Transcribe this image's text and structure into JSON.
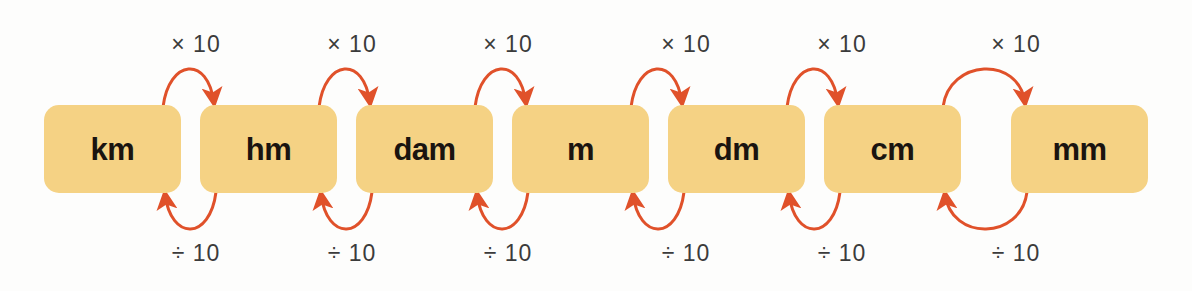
{
  "diagram": {
    "type": "unit-conversion-ladder",
    "background_color": "#fdfdfc",
    "box_fill_color": "#f5d284",
    "box_text_color": "#1a1410",
    "arrow_color": "#e0512a",
    "label_text_color": "#3b3b3b",
    "units": [
      {
        "label": "km",
        "x": 44,
        "y": 105,
        "width": 137,
        "height": 88
      },
      {
        "label": "hm",
        "x": 200,
        "y": 105,
        "width": 137,
        "height": 88
      },
      {
        "label": "dam",
        "x": 356,
        "y": 105,
        "width": 137,
        "height": 88
      },
      {
        "label": "m",
        "x": 512,
        "y": 105,
        "width": 137,
        "height": 88
      },
      {
        "label": "dm",
        "x": 668,
        "y": 105,
        "width": 137,
        "height": 88
      },
      {
        "label": "cm",
        "x": 824,
        "y": 105,
        "width": 137,
        "height": 88
      },
      {
        "label": "mm",
        "x": 1011,
        "y": 105,
        "width": 137,
        "height": 88
      }
    ],
    "multiply_label": "× 10",
    "divide_label": "÷ 10",
    "multiply_transitions": [
      {
        "from": "km",
        "to": "hm",
        "label": "× 10",
        "center_x": 196
      },
      {
        "from": "hm",
        "to": "dam",
        "label": "× 10",
        "center_x": 352
      },
      {
        "from": "dam",
        "to": "m",
        "label": "× 10",
        "center_x": 508
      },
      {
        "from": "m",
        "to": "dm",
        "label": "× 10",
        "center_x": 686
      },
      {
        "from": "dm",
        "to": "cm",
        "label": "× 10",
        "center_x": 842
      },
      {
        "from": "cm",
        "to": "mm",
        "label": "× 10",
        "center_x": 1016
      }
    ],
    "divide_transitions": [
      {
        "from": "hm",
        "to": "km",
        "label": "÷ 10",
        "center_x": 196
      },
      {
        "from": "dam",
        "to": "hm",
        "label": "÷ 10",
        "center_x": 352
      },
      {
        "from": "m",
        "to": "dam",
        "label": "÷ 10",
        "center_x": 508
      },
      {
        "from": "dm",
        "to": "m",
        "label": "÷ 10",
        "center_x": 686
      },
      {
        "from": "cm",
        "to": "dm",
        "label": "÷ 10",
        "center_x": 842
      },
      {
        "from": "mm",
        "to": "cm",
        "label": "÷ 10",
        "center_x": 1016
      }
    ]
  }
}
